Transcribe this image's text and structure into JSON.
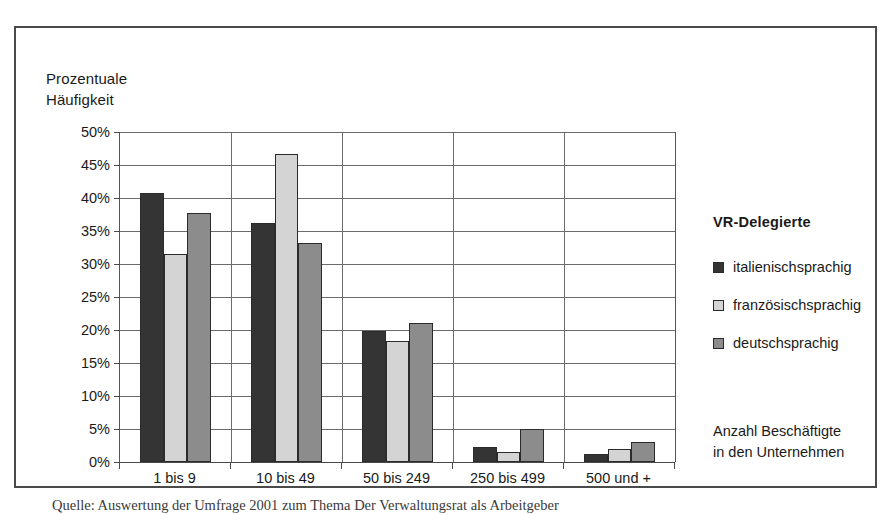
{
  "figure": {
    "y_axis_title": "Prozentuale\nHäufigkeit",
    "x_axis_title": "Anzahl Beschäftigte\nin den Unternehmen",
    "legend_title": "VR-Delegierte",
    "source_caption": "Quelle: Auswertung der Umfrage 2001 zum Thema Der Verwaltungsrat als Arbeitgeber"
  },
  "colors": {
    "series_italian": "#343434",
    "series_french": "#d4d4d4",
    "series_german": "#8c8c8c",
    "frame": "#4a4a4a",
    "gridline": "#6b6b6b"
  },
  "chart_data": {
    "type": "bar",
    "title": "",
    "subtitle": "",
    "xlabel": "Anzahl Beschäftigte in den Unternehmen",
    "ylabel": "Prozentuale Häufigkeit",
    "ylim": [
      0,
      50
    ],
    "ytick_labels": [
      "0%",
      "5%",
      "10%",
      "15%",
      "20%",
      "25%",
      "30%",
      "35%",
      "40%",
      "45%",
      "50%"
    ],
    "ytick_values": [
      0,
      5,
      10,
      15,
      20,
      25,
      30,
      35,
      40,
      45,
      50
    ],
    "grid": true,
    "legend_position": "right",
    "legend_title": "VR-Delegierte",
    "categories": [
      "1 bis 9",
      "10 bis 49",
      "50 bis 249",
      "250 bis 499",
      "500 und +"
    ],
    "series": [
      {
        "name": "italienischsprachig",
        "color": "#343434",
        "values": [
          40.7,
          36.2,
          19.9,
          2.3,
          1.2
        ]
      },
      {
        "name": "französischsprachig",
        "color": "#d4d4d4",
        "values": [
          31.5,
          46.7,
          18.4,
          1.5,
          2.0
        ]
      },
      {
        "name": "deutschsprachig",
        "color": "#8c8c8c",
        "values": [
          37.8,
          33.2,
          21.0,
          5.0,
          3.1
        ]
      }
    ]
  }
}
